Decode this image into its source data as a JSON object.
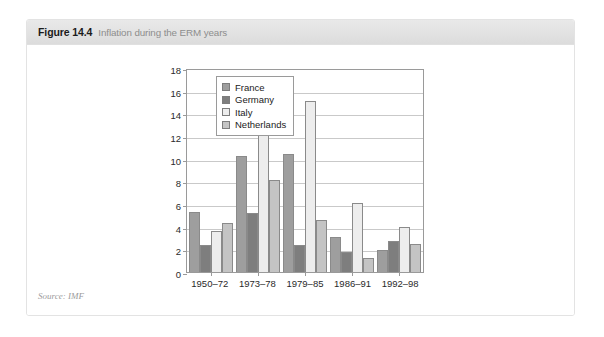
{
  "figure": {
    "number": "Figure 14.4",
    "title": "Inflation during the ERM years",
    "watermark": "",
    "source": "Source: IMF"
  },
  "chart_data": {
    "type": "bar",
    "title": "Inflation during the ERM years",
    "xlabel": "",
    "ylabel": "",
    "ylim": [
      0,
      18
    ],
    "yticks": [
      0,
      2,
      4,
      6,
      8,
      10,
      12,
      14,
      16,
      18
    ],
    "grid": true,
    "legend_position": "top-right",
    "categories": [
      "1950–72",
      "1973–78",
      "1979–85",
      "1986–91",
      "1992–98"
    ],
    "series": [
      {
        "name": "France",
        "color": "#9e9e9e",
        "values": [
          5.3,
          10.2,
          10.4,
          3.1,
          1.9
        ]
      },
      {
        "name": "Germany",
        "color": "#7e7e7e",
        "values": [
          2.4,
          5.2,
          2.4,
          1.8,
          2.75
        ]
      },
      {
        "name": "Italy",
        "color": "#ededed",
        "values": [
          3.6,
          15.7,
          15.1,
          6.1,
          4.0
        ]
      },
      {
        "name": "Netherlands",
        "color": "#c4c4c4",
        "values": [
          4.3,
          8.1,
          4.6,
          1.2,
          2.5
        ]
      }
    ]
  }
}
